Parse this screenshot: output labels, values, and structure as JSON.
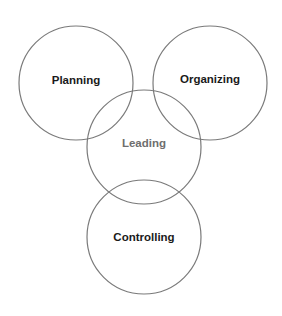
{
  "diagram": {
    "type": "venn",
    "background": "#ffffff",
    "stroke_color": "#7a7a7a",
    "nodes": [
      {
        "id": "planning",
        "label": "Planning",
        "cx": 76,
        "cy": 83,
        "r": 57,
        "label_y": 80,
        "text_color": "#1a1a1a"
      },
      {
        "id": "organizing",
        "label": "Organizing",
        "cx": 210,
        "cy": 83,
        "r": 57,
        "label_y": 79,
        "text_color": "#1a1a1a"
      },
      {
        "id": "leading",
        "label": "Leading",
        "cx": 144,
        "cy": 147,
        "r": 57,
        "label_y": 143,
        "text_color": "#6e6e6e"
      },
      {
        "id": "controlling",
        "label": "Controlling",
        "cx": 144,
        "cy": 237,
        "r": 57,
        "label_y": 237,
        "text_color": "#1a1a1a"
      }
    ]
  }
}
